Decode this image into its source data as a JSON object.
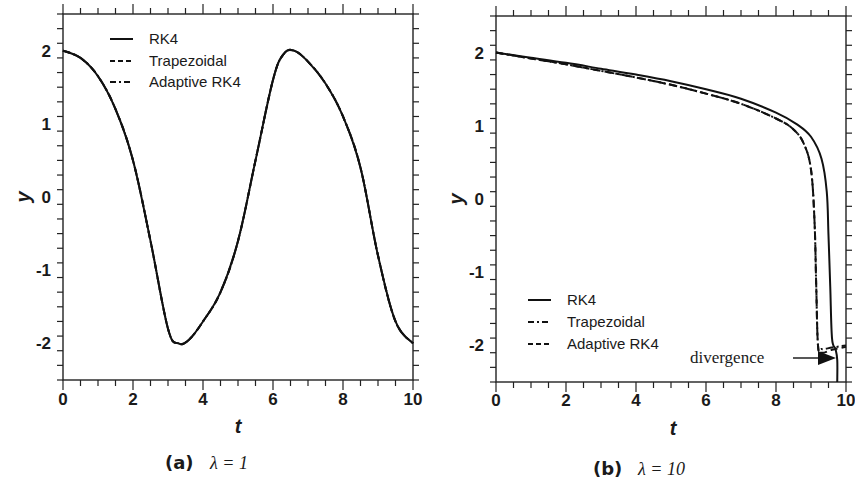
{
  "figure": {
    "panels": [
      {
        "caption_tag": "(a)",
        "caption_eq": "λ = 1",
        "xlabel": "t",
        "ylabel": "y",
        "xticks": [
          "0",
          "2",
          "4",
          "6",
          "8",
          "10"
        ],
        "yticks": [
          "2",
          "1",
          "0",
          "-1",
          "-2"
        ],
        "legend": [
          "RK4",
          "Trapezoidal",
          "Adaptive RK4"
        ]
      },
      {
        "caption_tag": "(b)",
        "caption_eq": "λ = 10",
        "xlabel": "t",
        "ylabel": "y",
        "xticks": [
          "0",
          "2",
          "4",
          "6",
          "8",
          "10"
        ],
        "yticks": [
          "2",
          "1",
          "0",
          "-1",
          "-2"
        ],
        "legend": [
          "RK4",
          "Trapezoidal",
          "Adaptive RK4"
        ],
        "annotation": "divergence"
      }
    ]
  },
  "chart_data": [
    {
      "type": "line",
      "title": "(a) λ = 1",
      "xlabel": "t",
      "ylabel": "y",
      "xlim": [
        0,
        10
      ],
      "ylim": [
        -2.5,
        2.5
      ],
      "grid": false,
      "legend_position": "upper left",
      "legend": [
        "RK4",
        "Trapezoidal",
        "Adaptive RK4"
      ],
      "x": [
        0,
        0.5,
        1,
        1.5,
        2,
        2.5,
        3,
        3.3,
        3.6,
        4,
        4.5,
        5,
        5.5,
        6,
        6.3,
        6.6,
        7,
        7.5,
        8,
        8.5,
        9,
        9.5,
        10
      ],
      "series": [
        {
          "name": "RK4",
          "style": "solid",
          "values": [
            2.0,
            1.9,
            1.65,
            1.2,
            0.5,
            -0.6,
            -1.8,
            -2.0,
            -1.95,
            -1.7,
            -1.3,
            -0.6,
            0.5,
            1.6,
            1.95,
            2.0,
            1.85,
            1.55,
            1.1,
            0.4,
            -0.8,
            -1.7,
            -2.0
          ]
        },
        {
          "name": "Trapezoidal",
          "style": "dashed",
          "values": [
            2.0,
            1.9,
            1.65,
            1.2,
            0.5,
            -0.6,
            -1.8,
            -2.0,
            -1.95,
            -1.7,
            -1.3,
            -0.6,
            0.5,
            1.6,
            1.95,
            2.0,
            1.85,
            1.55,
            1.1,
            0.4,
            -0.8,
            -1.7,
            -2.0
          ]
        },
        {
          "name": "Adaptive RK4",
          "style": "dashdot",
          "values": [
            2.0,
            1.9,
            1.65,
            1.2,
            0.5,
            -0.6,
            -1.8,
            -2.0,
            -1.95,
            -1.7,
            -1.3,
            -0.6,
            0.5,
            1.6,
            1.95,
            2.0,
            1.85,
            1.55,
            1.1,
            0.4,
            -0.8,
            -1.7,
            -2.0
          ]
        }
      ]
    },
    {
      "type": "line",
      "title": "(b) λ = 10",
      "xlabel": "t",
      "ylabel": "y",
      "xlim": [
        0,
        10
      ],
      "ylim": [
        -2.5,
        2.5
      ],
      "grid": false,
      "legend_position": "lower left",
      "legend": [
        "RK4",
        "Trapezoidal",
        "Adaptive RK4"
      ],
      "annotations": [
        {
          "text": "divergence",
          "arrow_to": [
            9.75,
            -2.2
          ]
        }
      ],
      "series": [
        {
          "name": "RK4",
          "style": "solid",
          "x": [
            0,
            1,
            2,
            3,
            4,
            5,
            6,
            7,
            8,
            8.6,
            9.0,
            9.3,
            9.45,
            9.5,
            9.55,
            9.6,
            9.7,
            9.75,
            9.75
          ],
          "values": [
            2.0,
            1.93,
            1.86,
            1.78,
            1.7,
            1.61,
            1.5,
            1.37,
            1.18,
            1.02,
            0.85,
            0.55,
            0.1,
            -0.5,
            -1.2,
            -1.9,
            -2.05,
            -2.2,
            -2.5
          ]
        },
        {
          "name": "Trapezoidal",
          "style": "dashdot",
          "x": [
            0,
            1,
            2,
            3,
            4,
            5,
            6,
            7,
            8,
            8.5,
            8.8,
            9.0,
            9.1,
            9.15,
            9.2,
            9.3,
            9.6,
            10
          ],
          "values": [
            2.0,
            1.92,
            1.84,
            1.75,
            1.66,
            1.56,
            1.44,
            1.3,
            1.1,
            0.95,
            0.75,
            0.4,
            -0.3,
            -1.2,
            -2.0,
            -2.05,
            -2.03,
            -2.0
          ]
        },
        {
          "name": "Adaptive RK4",
          "style": "dashed",
          "x": [
            0,
            1,
            2,
            3,
            4,
            5,
            6,
            7,
            8,
            8.5,
            8.8,
            9.0,
            9.1,
            9.15,
            9.2,
            9.3,
            9.6,
            10
          ],
          "values": [
            2.0,
            1.92,
            1.84,
            1.75,
            1.66,
            1.56,
            1.44,
            1.3,
            1.1,
            0.95,
            0.75,
            0.4,
            -0.3,
            -1.2,
            -2.0,
            -2.1,
            -2.06,
            -2.02
          ]
        }
      ]
    }
  ]
}
